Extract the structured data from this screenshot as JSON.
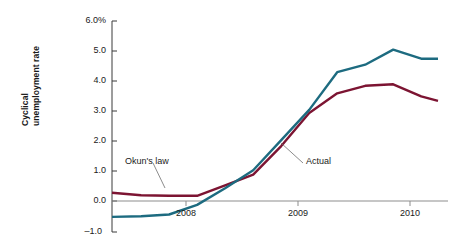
{
  "chart_data": {
    "type": "line",
    "title": "",
    "xlabel": "",
    "ylabel": "Cyclical unemployment rate",
    "ylabel_lines": [
      "Cyclical",
      "unemployment rate"
    ],
    "ylim": [
      -1.0,
      6.0
    ],
    "xlim": [
      2007.34,
      2010.25
    ],
    "grid": false,
    "legend": "annotations on lines",
    "y_ticks": [
      {
        "value": 6.0,
        "label": "6.0%"
      },
      {
        "value": 5.0,
        "label": "5.0"
      },
      {
        "value": 4.0,
        "label": "4.0"
      },
      {
        "value": 3.0,
        "label": "3.0"
      },
      {
        "value": 2.0,
        "label": "2.0"
      },
      {
        "value": 1.0,
        "label": "1.0"
      },
      {
        "value": 0.0,
        "label": "0.0"
      },
      {
        "value": -1.0,
        "label": "–1.0"
      }
    ],
    "x_ticks": [
      {
        "value": 2008,
        "label": "2008"
      },
      {
        "value": 2009,
        "label": "2009"
      },
      {
        "value": 2010,
        "label": "2010"
      }
    ],
    "zero_line": 0.0,
    "series": [
      {
        "name": "Okun's law",
        "color": "#7c1432",
        "label_text": "Okun's law",
        "x": [
          2007.34,
          2007.6,
          2007.85,
          2008.1,
          2008.35,
          2008.6,
          2008.85,
          2009.1,
          2009.35,
          2009.6,
          2009.85,
          2010.1,
          2010.25
        ],
        "values": [
          0.3,
          0.22,
          0.2,
          0.2,
          0.55,
          0.9,
          1.85,
          2.95,
          3.6,
          3.85,
          3.9,
          3.5,
          3.35
        ]
      },
      {
        "name": "Actual",
        "color": "#1d6b80",
        "label_text": "Actual",
        "x": [
          2007.34,
          2007.6,
          2007.85,
          2008.1,
          2008.35,
          2008.6,
          2008.85,
          2009.1,
          2009.35,
          2009.6,
          2009.85,
          2010.1,
          2010.25
        ],
        "values": [
          -0.5,
          -0.48,
          -0.42,
          -0.1,
          0.45,
          1.05,
          2.05,
          3.05,
          4.3,
          4.55,
          5.05,
          4.75,
          4.75
        ]
      }
    ],
    "annotations": [
      {
        "text": "Okun's law",
        "series": "Okun's law"
      },
      {
        "text": "Actual",
        "series": "Actual"
      }
    ]
  }
}
